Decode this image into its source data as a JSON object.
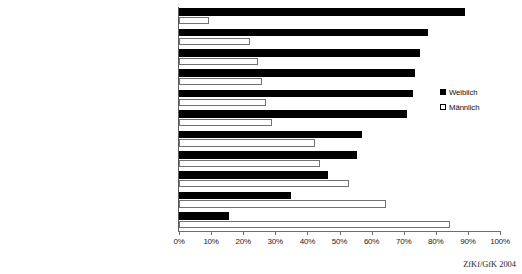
{
  "chart_data": {
    "type": "bar",
    "orientation": "horizontal",
    "title": "",
    "subtitle": "",
    "xlabel": "",
    "ylabel": "",
    "xlim": [
      0,
      100
    ],
    "xtick_labels": [
      "0%",
      "10%",
      "20%",
      "30%",
      "40%",
      "50%",
      "60%",
      "70%",
      "80%",
      "90%",
      "100%"
    ],
    "xtick_values": [
      0,
      10,
      20,
      30,
      40,
      50,
      60,
      70,
      80,
      90,
      100
    ],
    "grid": false,
    "legend_position": "right",
    "categories": [
      "Ballett/Tanzen/Jazzdance",
      "Schreiben von Gedichten, Artikeln etc.",
      "Malerei, Bildende Kunst",
      "Basteln, Gestalten",
      "Singen (alleine, Chor, Band etc.)",
      "Theater spielen",
      "Fotografieren",
      "Musikinstrument spielen",
      "Design, Layout",
      "Mit Video-/Digitalkamera arbeiten",
      "Sprayen"
    ],
    "series": [
      {
        "name": "Weiblich",
        "color": "#000000",
        "style": "filled",
        "values": [
          89,
          77.5,
          75,
          73.5,
          73,
          71,
          57,
          55.5,
          46.5,
          35,
          15.5
        ]
      },
      {
        "name": "Männlich",
        "color": "#ffffff",
        "style": "hollow",
        "values": [
          9.5,
          22,
          24.5,
          26,
          27,
          29,
          42.5,
          44,
          53,
          64.5,
          84.5
        ]
      }
    ]
  },
  "legend": {
    "entries": [
      {
        "label": "Weiblich",
        "swatch": "filled-square-icon"
      },
      {
        "label": "Männlich",
        "swatch": "hollow-square-icon"
      }
    ]
  },
  "source": {
    "text": "ZfKf/GfK 2004"
  }
}
